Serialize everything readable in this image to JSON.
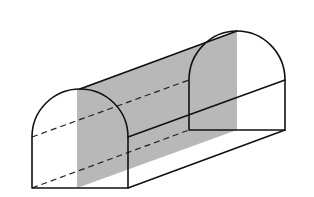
{
  "figure": {
    "type": "3d-solid-with-cross-section",
    "colors": {
      "edge": "#111111",
      "hidden_edge": "#222222",
      "section_fill": "#b8b8b8",
      "background": "#ffffff"
    },
    "front_face": {
      "bottom_left": [
        32,
        188
      ],
      "bottom_right": [
        128,
        188
      ],
      "spring_left": [
        32,
        137
      ],
      "spring_right": [
        128,
        137
      ],
      "arch_top": [
        80,
        89
      ]
    },
    "back_face": {
      "bottom_left": [
        189,
        130
      ],
      "bottom_right": [
        285,
        130
      ],
      "spring_left": [
        189,
        80
      ],
      "spring_right": [
        285,
        80
      ],
      "arch_top": [
        237,
        31
      ]
    },
    "section_plane": {
      "front_top": [
        77,
        89
      ],
      "back_top": [
        237,
        31
      ],
      "back_bottom": [
        237,
        130
      ],
      "front_bottom": [
        77,
        188
      ]
    }
  }
}
